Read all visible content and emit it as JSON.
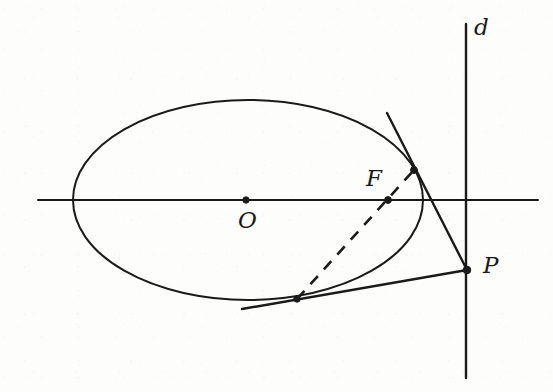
{
  "figure": {
    "kind": "geometry-diagram",
    "width": 553,
    "height": 392,
    "background_color": "#fdfdfc",
    "ink_color": "#1a1a1a"
  },
  "labels": {
    "directrix": "d",
    "center": "O",
    "focus": "F",
    "external_point": "P"
  },
  "label_positions": {
    "directrix": {
      "x": 474,
      "y": 16
    },
    "center": {
      "x": 238,
      "y": 209
    },
    "focus": {
      "x": 366,
      "y": 167
    },
    "external_point": {
      "x": 483,
      "y": 254
    }
  },
  "geometry": {
    "ellipse": {
      "name": "conic",
      "cx": 248,
      "cy": 200,
      "rx": 175,
      "ry": 100,
      "stroke_width": 2.0
    },
    "axis_horizontal": {
      "name": "major-axis",
      "x1": 38,
      "y1": 200,
      "x2": 538,
      "y2": 200,
      "stroke_width": 2.0
    },
    "directrix_line": {
      "name": "directrix-d",
      "x1": 466,
      "y1": 24,
      "x2": 466,
      "y2": 378,
      "stroke_width": 2.4
    },
    "tangent_upper": {
      "name": "tangent-upper",
      "x1": 387,
      "y1": 113,
      "x2": 467,
      "y2": 270,
      "stroke_width": 2.4
    },
    "tangent_lower": {
      "name": "tangent-lower",
      "x1": 242,
      "y1": 309,
      "x2": 467,
      "y2": 270,
      "stroke_width": 2.4
    },
    "chord_dashed": {
      "name": "focal-chord",
      "x1": 297,
      "y1": 299,
      "x2": 414,
      "y2": 170,
      "stroke_width": 2.6,
      "dash_pattern": "11 9"
    }
  },
  "points": [
    {
      "name": "point-O",
      "label": "O",
      "x": 246,
      "y": 200,
      "radius": 3.2,
      "filled": true
    },
    {
      "name": "point-F",
      "label": "F",
      "x": 388,
      "y": 200,
      "radius": 3.4,
      "filled": true
    },
    {
      "name": "point-P",
      "label": "P",
      "x": 467,
      "y": 270,
      "radius": 3.8,
      "filled": true
    },
    {
      "name": "tangency-point-upper",
      "label": "",
      "x": 414,
      "y": 170,
      "radius": 3.4,
      "filled": true
    },
    {
      "name": "tangency-point-lower",
      "label": "",
      "x": 297,
      "y": 299,
      "radius": 3.2,
      "filled": true
    }
  ]
}
